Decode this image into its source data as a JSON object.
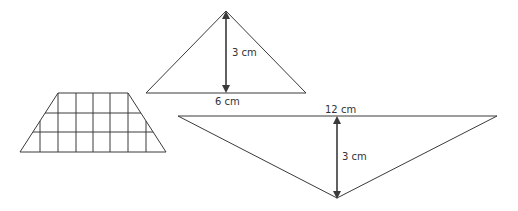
{
  "figures": {
    "trapezoid": {
      "description": "trapezoid divided into a grid",
      "rows": 3
    },
    "small_triangle": {
      "height_label": "3 cm",
      "base_label": "6 cm"
    },
    "large_triangle": {
      "height_label": "3 cm",
      "base_label": "12 cm"
    }
  },
  "colors": {
    "stroke": "#3a3a3a",
    "text": "#333333"
  }
}
